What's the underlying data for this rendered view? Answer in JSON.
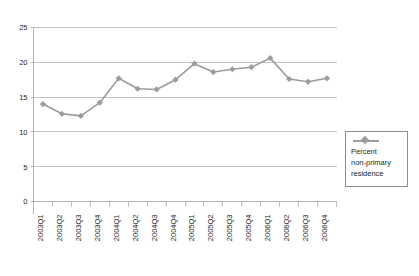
{
  "chart_data": {
    "type": "line",
    "title": "",
    "xlabel": "",
    "ylabel": "",
    "ylim": [
      0,
      25
    ],
    "yticks": [
      0,
      5,
      10,
      15,
      20,
      25
    ],
    "grid": true,
    "legend_position": "right",
    "series_color": "#9c9c9c",
    "marker": "diamond",
    "categories": [
      "2003Q1",
      "2003Q2",
      "2003Q3",
      "2003Q4",
      "2004Q1",
      "2004Q2",
      "2004Q3",
      "2004Q4",
      "2005Q1",
      "2005Q2",
      "2005Q3",
      "2005Q4",
      "2006Q1",
      "2006Q2",
      "2006Q3",
      "2006Q4"
    ],
    "series": [
      {
        "name": "Percent non-primary residence",
        "values": [
          14.0,
          12.6,
          12.3,
          14.2,
          17.7,
          16.2,
          16.1,
          17.5,
          19.8,
          18.6,
          19.0,
          19.3,
          20.6,
          17.6,
          17.2,
          17.7
        ]
      }
    ]
  },
  "legend": {
    "entries": [
      {
        "label_line1": "Percent",
        "label_line2": "non-primary",
        "label_line3": "residence",
        "marker_name": "diamond-line-marker"
      }
    ]
  }
}
